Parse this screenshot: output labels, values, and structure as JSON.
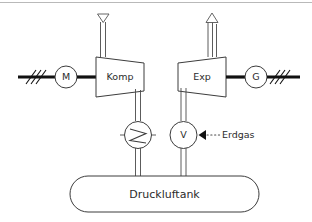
{
  "diagram": {
    "background_color": "#ffffff",
    "line_color": "#3c3c3c",
    "shaft_color": "#111111",
    "frame_color": "#b9b9b9",
    "nodes": {
      "motor": {
        "label": "M",
        "name": "motor"
      },
      "compressor": {
        "label": "Komp",
        "name": "compressor"
      },
      "expander": {
        "label": "Exp",
        "name": "expander"
      },
      "generator": {
        "label": "G",
        "name": "generator"
      },
      "cooler": {
        "label": "",
        "name": "heat-exchanger"
      },
      "valve": {
        "label": "V",
        "name": "valve"
      },
      "tank": {
        "label": "Druckluftank",
        "name": "compressed-air-tank"
      }
    },
    "annotations": {
      "fuel": {
        "label": "Erdgas"
      },
      "air_intake": {
        "icon": "triangle-down-icon"
      },
      "exhaust": {
        "icon": "triangle-up-icon"
      }
    }
  }
}
